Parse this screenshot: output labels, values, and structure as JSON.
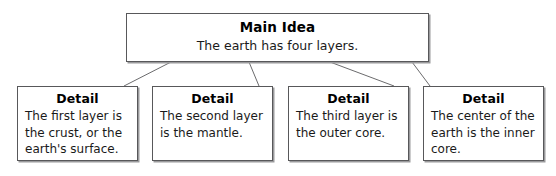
{
  "diagram": {
    "type": "main-idea-and-details-graphic-organizer",
    "colors": {
      "background": "#ffffff",
      "box_border": "#58585a",
      "box_shadow": "#9a9a9c",
      "connector": "#6b6b6d",
      "text": "#000000"
    },
    "main": {
      "title": "Main Idea",
      "text": "The earth has four layers."
    },
    "details": [
      {
        "title": "Detail",
        "text": "The first layer is the crust, or the earth's surface."
      },
      {
        "title": "Detail",
        "text": "The second layer is the mantle."
      },
      {
        "title": "Detail",
        "text": "The third layer is the outer core."
      },
      {
        "title": "Detail",
        "text": "The center of the earth is the inner core."
      }
    ],
    "connectors": [
      {
        "from_x": 171,
        "from_y": 62,
        "to_x": 124,
        "to_y": 86
      },
      {
        "from_x": 249,
        "from_y": 62,
        "to_x": 259,
        "to_y": 86
      },
      {
        "from_x": 330,
        "from_y": 62,
        "to_x": 394,
        "to_y": 86
      },
      {
        "from_x": 412,
        "from_y": 62,
        "to_x": 430,
        "to_y": 86
      }
    ]
  }
}
